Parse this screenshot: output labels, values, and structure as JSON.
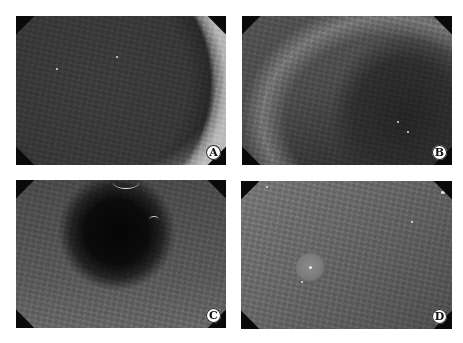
{
  "figure": {
    "panels": [
      {
        "id": "A",
        "label": "A",
        "content": "dark lumen with bright curved mucosal wall on right"
      },
      {
        "id": "B",
        "label": "B",
        "content": "textured mucosal surface with shadowed fold at lower right"
      },
      {
        "id": "C",
        "label": "C",
        "content": "dark central lumen with small bright reflective arcs at top"
      },
      {
        "id": "D",
        "label": "D",
        "content": "mucosal surface with small round raised lesion at left-center"
      }
    ]
  },
  "colors": {
    "background": "#ffffff",
    "label_bg": "#ffffff",
    "label_text": "#111111",
    "corner_mask": "#0a0a0a"
  }
}
